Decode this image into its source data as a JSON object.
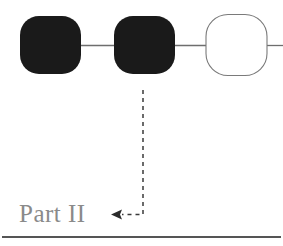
{
  "canvas": {
    "width": 283,
    "height": 246,
    "background": "#ffffff"
  },
  "diagram": {
    "type": "chain-of-nodes",
    "title": "",
    "node_fill_filled": "#1a1a1a",
    "node_fill_empty": "#ffffff",
    "node_stroke_empty": "#7a7a7a",
    "connector_color": "#6e6e6e",
    "annotation_color": "#3a3a3a",
    "rule_color": "#555555",
    "nodes": [
      {
        "id": "node-1",
        "state": "filled",
        "label": "",
        "x": 20,
        "y": 16,
        "width": 61,
        "height": 58,
        "radius": 19
      },
      {
        "id": "node-2",
        "state": "filled",
        "label": "",
        "x": 114,
        "y": 16,
        "width": 61,
        "height": 58,
        "radius": 19
      },
      {
        "id": "node-3",
        "state": "empty",
        "label": "",
        "x": 206,
        "y": 14,
        "width": 62,
        "height": 62,
        "radius": 22
      }
    ],
    "connectors": [
      {
        "id": "connector-1-2",
        "from": "node-1",
        "to": "node-2",
        "x1": 81,
        "x2": 114,
        "y": 45
      },
      {
        "id": "connector-2-3",
        "from": "node-2",
        "to": "node-3",
        "x1": 175,
        "x2": 206,
        "y": 45
      },
      {
        "id": "connector-3-right",
        "from": "node-3",
        "to": "edge",
        "x1": 268,
        "x2": 283,
        "y": 45
      }
    ],
    "callout": {
      "id": "part-ii-callout",
      "style": "dashed",
      "source_node": "node-2",
      "path": "M 143 90 L 143 215 L 120 215",
      "arrow_direction": "left",
      "arrow_tip_x": 111,
      "arrow_tip_y": 215,
      "dash_pattern": "4 4"
    }
  },
  "labels": {
    "part_label": "Part II"
  },
  "footer_rule": {
    "id": "footer-rule",
    "x1": 2,
    "x2": 281,
    "y": 237,
    "thickness": 2
  }
}
